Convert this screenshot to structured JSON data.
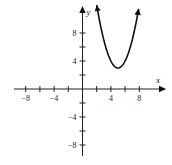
{
  "chart_data": {
    "type": "line",
    "title": "",
    "xlabel": "x",
    "ylabel": "y",
    "xlim": [
      -9,
      11.5
    ],
    "ylim": [
      -9.5,
      11.5
    ],
    "x_ticks": [
      -8,
      -6,
      -4,
      -2,
      2,
      4,
      6,
      8
    ],
    "y_ticks": [
      -8,
      -6,
      -4,
      -2,
      2,
      4,
      6,
      8
    ],
    "x_tick_labels": [
      {
        "value": -8,
        "label": "−8"
      },
      {
        "value": -4,
        "label": "−4"
      },
      {
        "value": 4,
        "label": "4"
      },
      {
        "value": 8,
        "label": "8"
      }
    ],
    "y_tick_labels": [
      {
        "value": 8,
        "label": "8"
      },
      {
        "value": 4,
        "label": "4"
      },
      {
        "value": -4,
        "label": "−4"
      },
      {
        "value": -8,
        "label": "−8"
      }
    ],
    "grid": false,
    "legend": null,
    "series": [
      {
        "name": "parabola",
        "equation": "y = (x - 5)^2 + 3",
        "vertex": [
          5,
          3
        ],
        "x_range": [
          2,
          7.9
        ],
        "arrows_at_ends": true,
        "color": "#111111",
        "x": [
          2,
          2.5,
          3,
          3.5,
          4,
          4.5,
          5,
          5.5,
          6,
          6.5,
          7,
          7.5,
          7.9
        ],
        "values": [
          12,
          9.25,
          7,
          5.25,
          4,
          3.25,
          3,
          3.25,
          4,
          5.25,
          7,
          9.25,
          11.41
        ]
      }
    ]
  },
  "layout": {
    "origin_px": [
      82.5,
      89
    ],
    "px_per_unit_x": 7.1,
    "px_per_unit_y": 7.0,
    "x_axis_px": [
      14,
      165
    ],
    "y_axis_px": [
      7,
      156
    ]
  },
  "colors": {
    "axis": "#222222",
    "curve": "#111111"
  }
}
